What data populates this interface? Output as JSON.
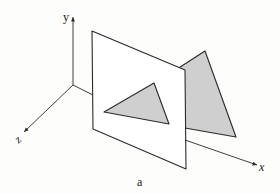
{
  "diagram": {
    "caption": "a",
    "axes": {
      "x_label": "x",
      "y_label": "y",
      "z_label": "z"
    },
    "colors": {
      "background": "#fdfdfb",
      "line": "#2a2a2a",
      "triangle_fill": "#cfcfcf",
      "plane_fill": "#ffffff"
    },
    "elements": [
      {
        "name": "coordinate-axes",
        "description": "3D axes x, y, z from origin"
      },
      {
        "name": "projection-plane",
        "description": "square plane parallel to y-z plane"
      },
      {
        "name": "front-triangle",
        "description": "shaded triangle drawn on the plane"
      },
      {
        "name": "back-triangle",
        "description": "larger shaded triangle behind the plane"
      }
    ]
  }
}
